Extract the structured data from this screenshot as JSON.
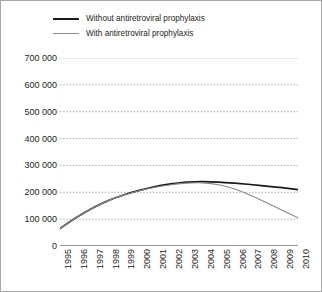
{
  "chart_data": {
    "type": "line",
    "title": "",
    "subtitle": "",
    "xlabel": "",
    "ylabel": "",
    "grid": "horizontal-dotted",
    "legend_position": "top-left",
    "categories": [
      "1995",
      "1996",
      "1997",
      "1998",
      "1999",
      "2000",
      "2001",
      "2002",
      "2003",
      "2004",
      "2005",
      "2006",
      "2007",
      "2008",
      "2009",
      "2010"
    ],
    "x": [
      1995,
      1996,
      1997,
      1998,
      1999,
      2000,
      2001,
      2002,
      2003,
      2004,
      2005,
      2006,
      2007,
      2008,
      2009,
      2010
    ],
    "xlim": [
      1995,
      2010
    ],
    "ylim": [
      0,
      700000
    ],
    "y_ticks": [
      0,
      100000,
      200000,
      300000,
      400000,
      500000,
      600000,
      700000
    ],
    "y_tick_labels": [
      "0",
      "100 000",
      "200 000",
      "300 000",
      "400 000",
      "500 000",
      "600 000",
      "700 000"
    ],
    "series": [
      {
        "name": "Without antiretroviral prophylaxis",
        "color": "#1a1a1a",
        "values": [
          65000,
          105000,
          140000,
          168000,
          190000,
          207000,
          221000,
          231000,
          238000,
          240000,
          238000,
          234000,
          229000,
          223000,
          217000,
          210000
        ]
      },
      {
        "name": "With antiretroviral prophylaxis",
        "color": "#8a8a8a",
        "values": [
          65000,
          105000,
          140000,
          168000,
          190000,
          206000,
          219000,
          228000,
          234000,
          235000,
          228000,
          212000,
          189000,
          162000,
          133000,
          105000
        ]
      }
    ]
  },
  "legend": {
    "items": [
      {
        "label": "Without antiretroviral prophylaxis"
      },
      {
        "label": "With antiretroviral prophylaxis"
      }
    ]
  },
  "colors": {
    "series_without": "#1a1a1a",
    "series_with": "#8a8a8a",
    "gridline": "#9b9b9b",
    "axis": "#9a9a9a",
    "frame": "#a8a8a8",
    "text": "#231f20"
  }
}
